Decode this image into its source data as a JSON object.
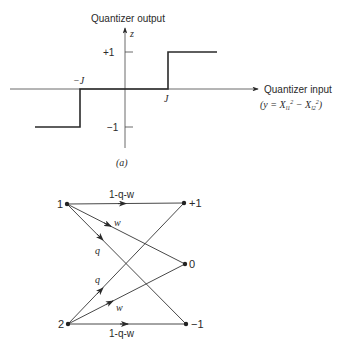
{
  "figure_a": {
    "y_axis_title": "Quantizer output",
    "y_axis_var": "z",
    "x_axis_title": "Quantizer input",
    "x_axis_formula": "(y = X",
    "formula_parts": [
      "(y = X",
      "l1",
      "2",
      " − X",
      "l2",
      "2",
      ")"
    ],
    "ticks": {
      "plus_one": "+1",
      "minus_one": "−1",
      "neg_J": "−J",
      "pos_J": "J"
    },
    "caption": "(a)"
  },
  "figure_b": {
    "left_nodes": [
      "1",
      "2"
    ],
    "right_nodes": [
      "+1",
      "0",
      "−1"
    ],
    "edges": [
      {
        "from": "1",
        "to": "+1",
        "label": "1-q-w"
      },
      {
        "from": "1",
        "to": "0",
        "label": "w"
      },
      {
        "from": "1",
        "to": "−1",
        "label": "q"
      },
      {
        "from": "2",
        "to": "+1",
        "label": "q"
      },
      {
        "from": "2",
        "to": "0",
        "label": "w"
      },
      {
        "from": "2",
        "to": "−1",
        "label": "1-q-w"
      }
    ]
  }
}
